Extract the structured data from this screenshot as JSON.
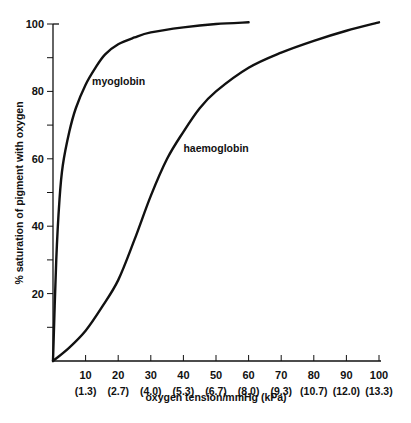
{
  "chart_data": {
    "type": "line",
    "title": "",
    "xlabel": "oxygen tension/mmHg (kPa)",
    "ylabel": "% saturation of pigment with oxygen",
    "xlim": [
      0,
      100
    ],
    "ylim": [
      0,
      100
    ],
    "grid": false,
    "legend": "inline labels",
    "x_ticks": [
      10,
      20,
      30,
      40,
      50,
      60,
      70,
      80,
      90,
      100
    ],
    "x_tick_labels": [
      "10",
      "20",
      "30",
      "40",
      "50",
      "60",
      "70",
      "80",
      "90",
      "100"
    ],
    "x_secondary_tick_labels": [
      "(1.3)",
      "(2.7)",
      "(4.0)",
      "(5.3)",
      "(6.7)",
      "(8.0)",
      "(9.3)",
      "(10.7)",
      "(12.0)",
      "(13.3)"
    ],
    "y_ticks": [
      10,
      20,
      30,
      40,
      50,
      60,
      70,
      80,
      90,
      100
    ],
    "y_tick_labels": [
      "20",
      "40",
      "60",
      "80",
      "100"
    ],
    "y_labeled_ticks": [
      20,
      40,
      60,
      80,
      100
    ],
    "series": [
      {
        "name": "myoglobin",
        "label_pos": [
          12,
          82
        ],
        "x": [
          0,
          1,
          2,
          3,
          5,
          7,
          10,
          13,
          16,
          20,
          25,
          30,
          40,
          50,
          60
        ],
        "y": [
          0,
          30,
          48,
          58,
          68,
          75,
          82,
          87,
          91,
          94,
          96,
          97.5,
          99,
          100,
          100.5
        ]
      },
      {
        "name": "haemoglobin",
        "label_pos": [
          40,
          62
        ],
        "x": [
          0,
          5,
          10,
          15,
          20,
          25,
          30,
          35,
          40,
          45,
          50,
          60,
          70,
          80,
          90,
          100
        ],
        "y": [
          0,
          4,
          9,
          16,
          24,
          36,
          49,
          60,
          68,
          75,
          80,
          87,
          91.5,
          95,
          98,
          100.5
        ]
      }
    ]
  }
}
